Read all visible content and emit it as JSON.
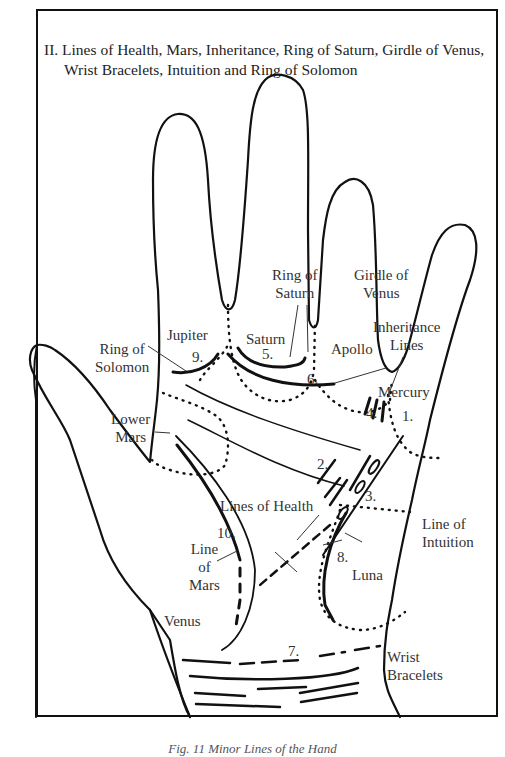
{
  "title": {
    "line1": "II.  Lines of Health, Mars, Inheritance, Ring of Saturn, Girdle of Venus,",
    "line2": "Wrist Bracelets, Intuition and Ring of Solomon"
  },
  "labels": {
    "jupiter": "Jupiter",
    "saturn": "Saturn",
    "apollo": "Apollo",
    "mercury": "Mercury",
    "ring_of_saturn_1": "Ring of",
    "ring_of_saturn_2": "Saturn",
    "girdle_of_venus_1": "Girdle of",
    "girdle_of_venus_2": "Venus",
    "inheritance_1": "Inheritance",
    "inheritance_2": "Lines",
    "ring_of_solomon_1": "Ring of",
    "ring_of_solomon_2": "Solomon",
    "lower_mars_1": "Lower",
    "lower_mars_2": "Mars",
    "lines_of_health": "Lines of Health",
    "line_of_intuition_1": "Line of",
    "line_of_intuition_2": "Intuition",
    "line_of_mars_1": "Line",
    "line_of_mars_2": "of",
    "line_of_mars_3": "Mars",
    "luna": "Luna",
    "venus": "Venus",
    "wrist_bracelets_1": "Wrist",
    "wrist_bracelets_2": "Bracelets"
  },
  "numbers": {
    "n1": "1.",
    "n2": "2.",
    "n3": "3.",
    "n4": "4.",
    "n5": "5.",
    "n6": "6.",
    "n7": "7.",
    "n8": "8.",
    "n9": "9.",
    "n10": "10."
  },
  "caption": "Fig. 11  Minor Lines of the Hand"
}
